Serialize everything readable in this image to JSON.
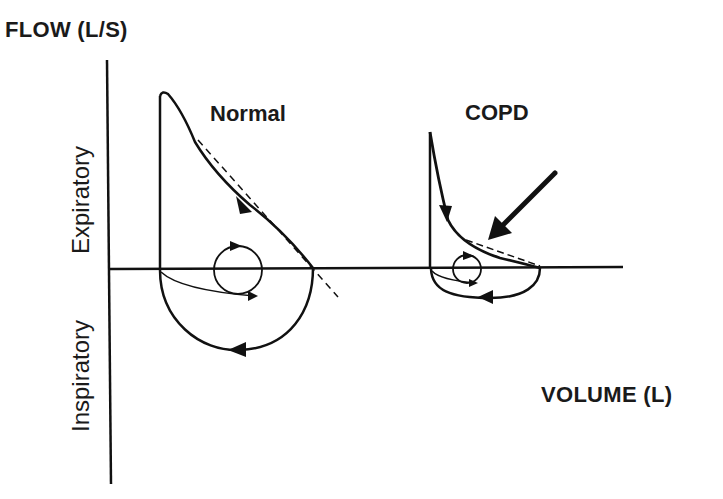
{
  "diagram": {
    "axes": {
      "y_label": "FLOW (L/S)",
      "x_label": "VOLUME (L)",
      "upper_region_label": "Expiratory",
      "lower_region_label": "Inspiratory"
    },
    "loops": [
      {
        "label": "Normal",
        "description": "Large expiratory triangle with linear descending limb, semicircular inspiratory limb; tidal breathing loop shown as small circle; dashed tangent line along descending limb"
      },
      {
        "label": "COPD",
        "description": "Small expiratory loop with concave (scooped) descending limb; arrow points at concavity; smaller inspiratory limb; tidal breathing loop near baseline; dashed tangent line"
      }
    ],
    "colors": {
      "stroke": "#111111",
      "background": "#ffffff"
    }
  }
}
